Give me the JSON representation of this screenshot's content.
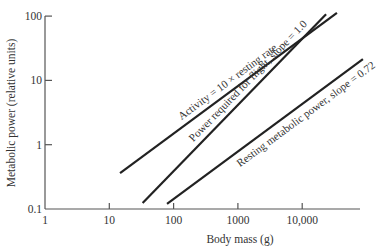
{
  "chart_data": {
    "type": "line",
    "title": "",
    "xlabel": "Body mass (g)",
    "ylabel": "Metabolic power (relative units)",
    "xscale": "log",
    "yscale": "log",
    "xlim": [
      1,
      100000
    ],
    "ylim": [
      0.1,
      100
    ],
    "xticks": [
      {
        "value": 1,
        "label": "1"
      },
      {
        "value": 10,
        "label": "10"
      },
      {
        "value": 100,
        "label": "100"
      },
      {
        "value": 1000,
        "label": "1000"
      },
      {
        "value": 10000,
        "label": "10,000"
      }
    ],
    "yticks": [
      {
        "value": 0.1,
        "label": "0.1"
      },
      {
        "value": 1,
        "label": "1"
      },
      {
        "value": 10,
        "label": "10"
      },
      {
        "value": 100,
        "label": "100"
      }
    ],
    "grid": false,
    "legend": "none",
    "series": [
      {
        "name": "Activity = 10 × resting rate",
        "x": [
          14.7,
          34700
        ],
        "y": [
          0.36,
          112
        ]
      },
      {
        "name": "Power required for flight, slope = 1.0",
        "x": [
          33,
          23500
        ],
        "y": [
          0.124,
          107
        ]
      },
      {
        "name": "Resting metabolic power, slope = 0.72",
        "x": [
          79,
          88000
        ],
        "y": [
          0.12,
          21.5
        ]
      }
    ],
    "annotations": [
      {
        "text": "Activity = 10 × resting rate",
        "series": 0
      },
      {
        "text": "Power required for flight, slope = 1.0",
        "series": 1
      },
      {
        "text": "Resting metabolic power, slope = 0.72",
        "series": 2
      }
    ]
  }
}
